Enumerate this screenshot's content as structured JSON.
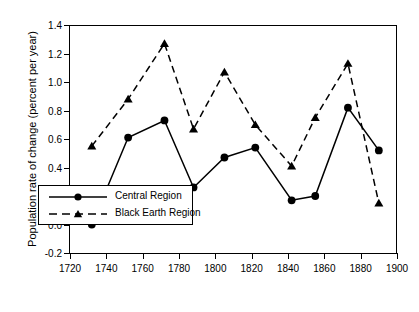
{
  "chart_data": {
    "type": "line",
    "title": "",
    "xlabel": "Year",
    "ylabel": "Population rate of change (percent per year)",
    "xlim": [
      1720,
      1900
    ],
    "ylim": [
      -0.2,
      1.4
    ],
    "xticks": [
      1720,
      1740,
      1760,
      1780,
      1800,
      1820,
      1840,
      1860,
      1880,
      1900
    ],
    "yticks": [
      -0.2,
      0.0,
      0.2,
      0.4,
      0.6,
      0.8,
      1.0,
      1.2,
      1.4
    ],
    "ytick_labels": [
      "-0.2",
      "0.0",
      "0.2",
      "0.4",
      "0.6",
      "0.8",
      "1.0",
      "1.2",
      "1.4"
    ],
    "xtick_labels": [
      "1720",
      "1740",
      "1760",
      "1780",
      "1800",
      "1820",
      "1840",
      "1860",
      "1880",
      "1900"
    ],
    "grid": false,
    "legend_position": "lower-left-inside",
    "x": [
      1732,
      1752,
      1772,
      1788,
      1805,
      1822,
      1842,
      1855,
      1873,
      1890
    ],
    "series": [
      {
        "name": "Central Region",
        "marker": "circle",
        "linestyle": "solid",
        "color": "#000000",
        "values": [
          0.0,
          0.61,
          0.73,
          0.26,
          0.47,
          0.54,
          0.17,
          0.2,
          0.82,
          0.52
        ]
      },
      {
        "name": "Black Earth Region",
        "marker": "triangle",
        "linestyle": "dashed",
        "color": "#000000",
        "values": [
          0.55,
          0.88,
          1.27,
          0.67,
          1.07,
          0.7,
          0.41,
          0.75,
          1.13,
          0.15
        ]
      }
    ]
  },
  "legend": {
    "entries": [
      {
        "label": "Central Region"
      },
      {
        "label": "Black Earth Region"
      }
    ]
  }
}
